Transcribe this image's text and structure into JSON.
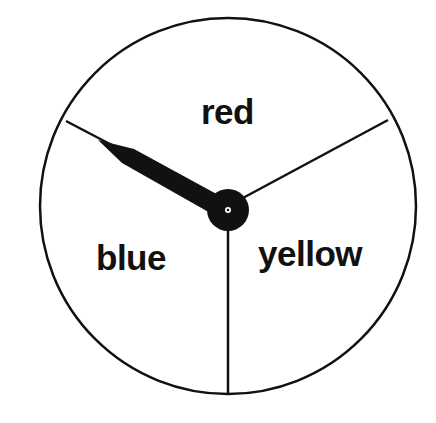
{
  "spinner": {
    "sections": [
      {
        "label": "red"
      },
      {
        "label": "blue"
      },
      {
        "label": "yellow"
      }
    ],
    "pointer_direction": "blue/red boundary (upper-left)",
    "colors": {
      "line": "#111111",
      "background": "#ffffff"
    }
  }
}
